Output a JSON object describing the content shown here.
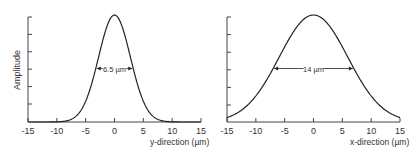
{
  "chart_data": [
    {
      "type": "line",
      "title": "",
      "xlabel": "y-direction (µm)",
      "ylabel": "Amplitude",
      "xlim": [
        -15,
        15
      ],
      "xticks": [
        -15,
        -10,
        -5,
        0,
        5,
        10,
        15
      ],
      "xtick_labels": [
        "-15",
        "-10",
        "-5",
        "0",
        "5",
        "10",
        "15"
      ],
      "yticks_count": 6,
      "ytick_labels": [],
      "grid": false,
      "legend": null,
      "series": [
        {
          "name": "profile",
          "shape": "gaussian",
          "center": 0,
          "fwhm": 6.5,
          "peak": 1.0
        }
      ],
      "annotation": {
        "text": "6.5 µm",
        "type": "fwhm-arrow",
        "from": -3.25,
        "to": 3.25,
        "level": 0.5
      }
    },
    {
      "type": "line",
      "title": "",
      "xlabel": "x-direction (µm)",
      "ylabel": "",
      "xlim": [
        -15,
        15
      ],
      "xticks": [
        -15,
        -10,
        -5,
        0,
        5,
        10,
        15
      ],
      "xtick_labels": [
        "-15",
        "-10",
        "-5",
        "0",
        "5",
        "10",
        "15"
      ],
      "yticks_count": 6,
      "ytick_labels": [],
      "grid": false,
      "legend": null,
      "series": [
        {
          "name": "profile",
          "shape": "gaussian",
          "center": 0,
          "fwhm": 14,
          "peak": 1.0
        }
      ],
      "annotation": {
        "text": "14 µm",
        "type": "fwhm-arrow",
        "from": -7,
        "to": 7,
        "level": 0.5
      }
    }
  ],
  "colors": {
    "line": "#222222",
    "axis": "#444444",
    "text": "#333333"
  }
}
